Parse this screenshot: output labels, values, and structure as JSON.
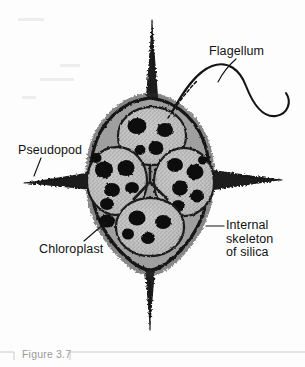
{
  "figure": {
    "caption": "Figure 3.7",
    "background_color": "#fdfdfd",
    "ink_color": "#121212",
    "caption_color": "#9b9b9b",
    "rule_color": "#c9c9c9"
  },
  "labels": [
    {
      "id": "flagellum",
      "text": "Flagellum",
      "lines": [
        "Flagellum"
      ],
      "x": 209,
      "y": 45,
      "leader": "curved-line-to-flagellum"
    },
    {
      "id": "pseudopod",
      "text": "Pseudopod",
      "lines": [
        "Pseudopod"
      ],
      "x": 18,
      "y": 144,
      "leader": "diagonal-line-to-left-spine"
    },
    {
      "id": "chloroplast",
      "text": "Chloroplast",
      "lines": [
        "Chloroplast"
      ],
      "x": 39,
      "y": 243,
      "leader": "diagonal-line-to-dark-organelle"
    },
    {
      "id": "internal-skeleton-of-silica",
      "text": "Internal\nskeleton\nof silica",
      "lines": [
        "Internal",
        "skeleton",
        "of silica"
      ],
      "x": 226,
      "y": 219,
      "leader": "horizontal-line-to-cell-wall"
    }
  ],
  "cell": {
    "description": "Star-shaped silicoflagellate with four tapering siliceous spines and four internal lobes",
    "center_x": 150,
    "center_y": 180,
    "spines": [
      {
        "name": "top-spine",
        "direction": "up",
        "tip_x": 152,
        "tip_y": 20
      },
      {
        "name": "bottom-spine",
        "direction": "down",
        "tip_x": 150,
        "tip_y": 330
      },
      {
        "name": "left-spine",
        "direction": "left",
        "tip_x": 24,
        "tip_y": 183
      },
      {
        "name": "right-spine",
        "direction": "right",
        "tip_x": 282,
        "tip_y": 180
      }
    ],
    "lobes": [
      {
        "name": "lobe-top",
        "cx": 152,
        "cy": 135,
        "rx": 33,
        "ry": 28,
        "chloroplast_count": 4
      },
      {
        "name": "lobe-left",
        "cx": 116,
        "cy": 180,
        "rx": 30,
        "ry": 33,
        "chloroplast_count": 5
      },
      {
        "name": "lobe-right",
        "cx": 185,
        "cy": 181,
        "rx": 30,
        "ry": 33,
        "chloroplast_count": 5
      },
      {
        "name": "lobe-bottom",
        "cx": 150,
        "cy": 227,
        "rx": 33,
        "ry": 28,
        "chloroplast_count": 4
      }
    ],
    "cytoplasm_color": "#b9b9b9",
    "chloroplast_color": "#0d0d0d",
    "wall_color": "#1a1a1a"
  },
  "flagellum": {
    "name": "flagellum",
    "description": "Long whip-like filament emerging from the upper right of the cell, curving in an S and hooking back",
    "origin_x": 172,
    "origin_y": 112
  }
}
